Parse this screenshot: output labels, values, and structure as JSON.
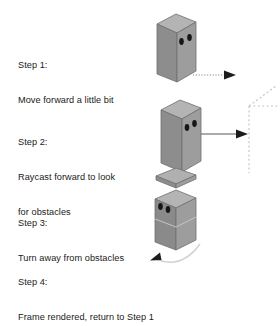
{
  "diagram": {
    "background_color": "#ffffff",
    "steps": [
      {
        "id": "step-1",
        "label": "Step 1:",
        "description_lines": [
          "Move forward a little bit"
        ],
        "graphic": "box-facing-right-with-dotted-motion-arrow"
      },
      {
        "id": "step-2",
        "label": "Step 2:",
        "description_lines": [
          "Raycast forward to look",
          "for obstacles"
        ],
        "graphic": "box-with-solid-raycast-arrow-to-dashed-wall"
      },
      {
        "id": "step-3",
        "label": "Step 3:",
        "description_lines": [
          "Turn away from obstacles"
        ],
        "graphic": "box-turned-left-with-rotation-arc-arrow"
      },
      {
        "id": "step-4",
        "label": "Step 4:",
        "description_lines": [
          "Frame rendered, return to Step 1"
        ],
        "graphic": "none"
      }
    ],
    "colors": {
      "box_left_face": "#8e8e8e",
      "box_right_face": "#9a9a9a",
      "box_top_face": "#b4b4b4",
      "box_outline": "#5a5a5a",
      "eye": "#1c1c1c",
      "arrow_dark": "#1c1c1c",
      "arrow_line": "#9a9a9a",
      "obstacle_dash": "#c8c8c8",
      "text": "#1a1a1a"
    }
  }
}
